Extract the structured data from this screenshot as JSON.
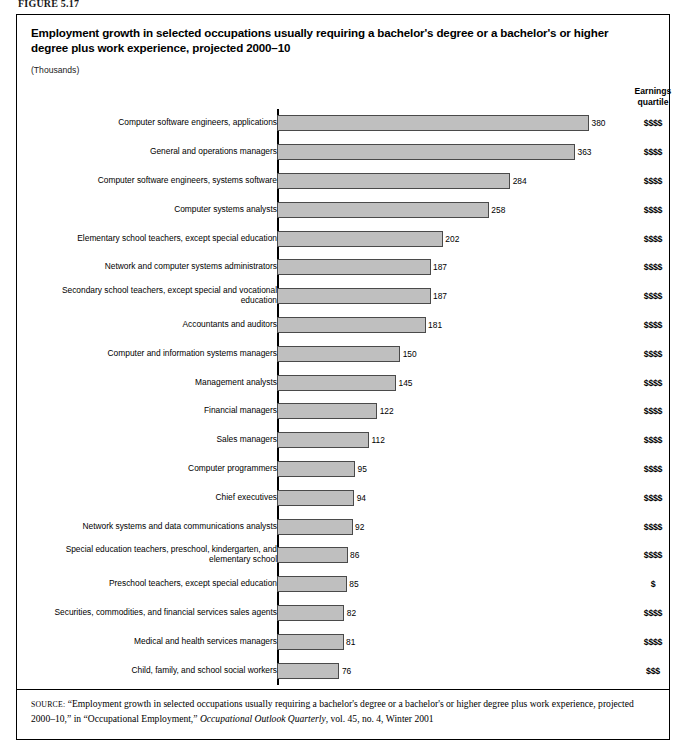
{
  "figure_label": "FIGURE 5.17",
  "figure": {
    "title": "Employment growth in selected occupations usually requiring a bachelor's degree or a bachelor's or higher degree plus work experience, projected 2000–10",
    "subtitle": "(Thousands)",
    "earnings_header_line1": "Earnings",
    "earnings_header_line2": "quartile"
  },
  "source_note": {
    "label": "SOURCE:",
    "text_part1": " “Employment growth in selected occupations usually requiring a bachelor's degree or a bachelor's or higher degree plus work experience, projected 2000–10,” in “Occupational Employment,” ",
    "journal": "Occupational Outlook Quarterly",
    "text_part2": ", vol. 45, no. 4, Winter 2001"
  },
  "colors": {
    "bar_fill": "#bfbfbf",
    "bar_border": "#4a4a4a",
    "frame": "#000000",
    "text": "#000000"
  },
  "chart_data": {
    "type": "bar",
    "orientation": "horizontal",
    "title": "Employment growth in selected occupations usually requiring a bachelor's degree or a bachelor's or higher degree plus work experience, projected 2000–10",
    "xlabel": "",
    "ylabel": "",
    "units": "Thousands",
    "xlim": [
      0,
      380
    ],
    "grid": false,
    "legend": null,
    "categories": [
      "Computer software engineers, applications",
      "General and operations managers",
      "Computer software engineers, systems software",
      "Computer systems analysts",
      "Elementary school teachers, except special education",
      "Network and computer systems administrators",
      "Secondary school teachers, except special and vocational education",
      "Accountants and auditors",
      "Computer and information systems managers",
      "Management analysts",
      "Financial managers",
      "Sales managers",
      "Computer programmers",
      "Chief executives",
      "Network systems and data communications analysts",
      "Special education teachers, preschool, kindergarten, and\nelementary school",
      "Preschool teachers, except special education",
      "Securities, commodities, and financial services sales agents",
      "Medical and health services managers",
      "Child, family, and school social workers"
    ],
    "values": [
      380,
      363,
      284,
      258,
      202,
      187,
      187,
      181,
      150,
      145,
      122,
      112,
      95,
      94,
      92,
      86,
      85,
      82,
      81,
      76
    ],
    "earnings_quartile": [
      "$$$$",
      "$$$$",
      "$$$$",
      "$$$$",
      "$$$$",
      "$$$$",
      "$$$$",
      "$$$$",
      "$$$$",
      "$$$$",
      "$$$$",
      "$$$$",
      "$$$$",
      "$$$$",
      "$$$$",
      "$$$$",
      "$",
      "$$$$",
      "$$$$",
      "$$$"
    ]
  }
}
